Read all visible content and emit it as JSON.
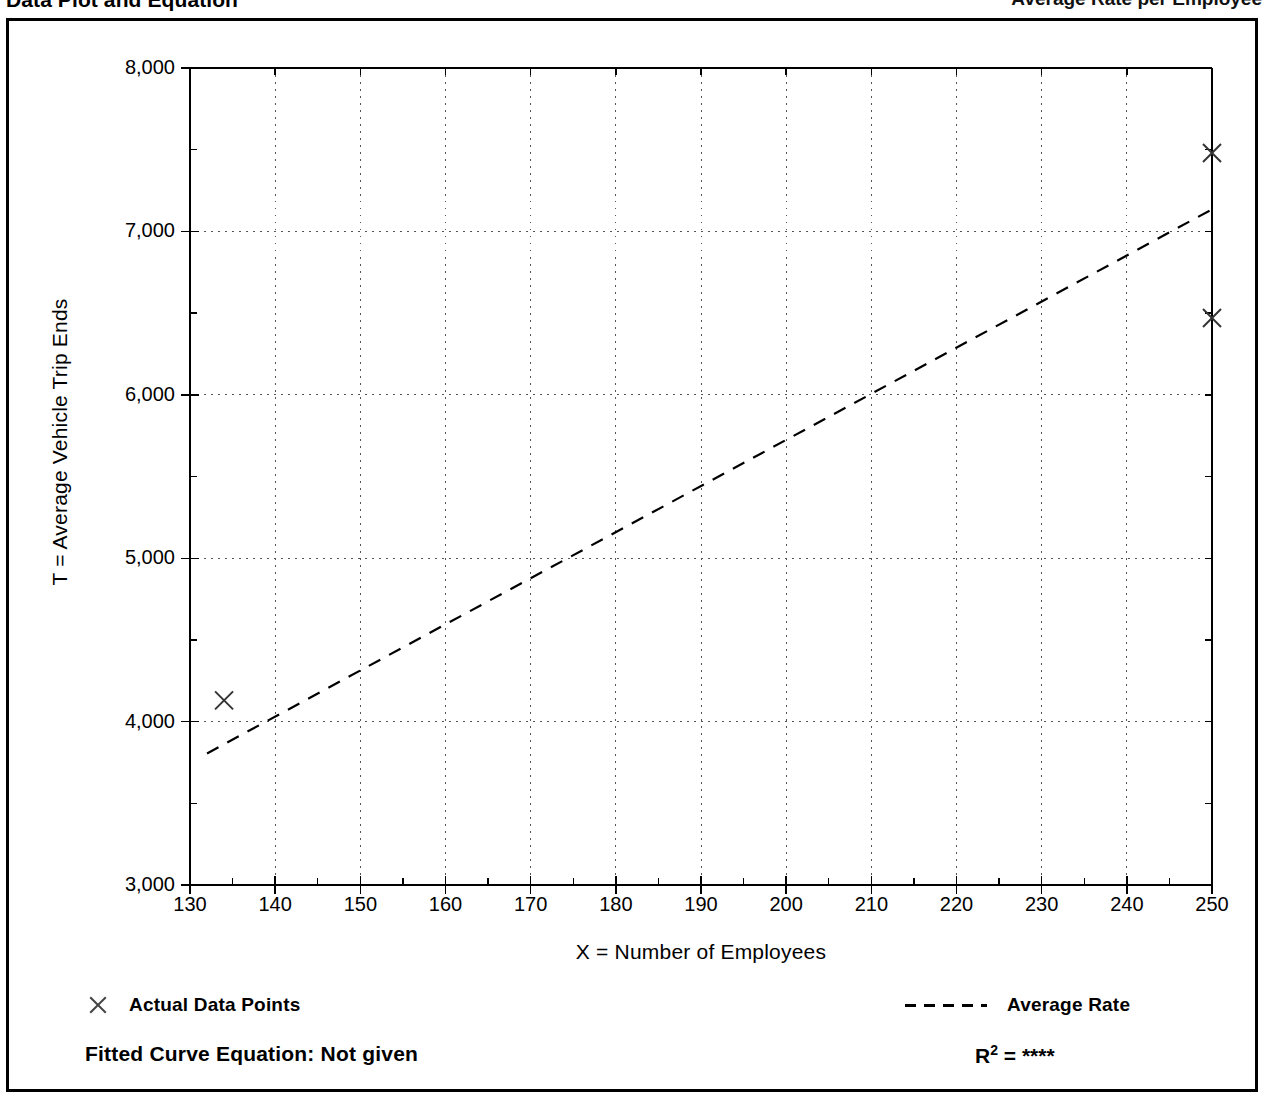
{
  "header": {
    "left_title": "Data Plot and Equation",
    "right_title": "Average Rate per Employee"
  },
  "chart_data": {
    "type": "scatter",
    "title": "",
    "xlabel": "X = Number of Employees",
    "ylabel": "T = Average Vehicle Trip Ends",
    "xlim": [
      130,
      250
    ],
    "ylim": [
      3000,
      8000
    ],
    "xticks": [
      130,
      140,
      150,
      160,
      170,
      180,
      190,
      200,
      210,
      220,
      230,
      240,
      250
    ],
    "xtick_labels": [
      "130",
      "140",
      "150",
      "160",
      "170",
      "180",
      "190",
      "200",
      "210",
      "220",
      "230",
      "240",
      "250"
    ],
    "yticks": [
      3000,
      4000,
      5000,
      6000,
      7000,
      8000
    ],
    "ytick_labels": [
      "3,000",
      "4,000",
      "5,000",
      "6,000",
      "7,000",
      "8,000"
    ],
    "grid": true,
    "grid_style": "dotted",
    "legend_position": "below-axes",
    "series": [
      {
        "name": "Actual Data Points",
        "type": "scatter",
        "marker": "x",
        "points": [
          {
            "x": 134,
            "y": 4130
          },
          {
            "x": 250,
            "y": 7480
          },
          {
            "x": 250,
            "y": 6470
          }
        ]
      },
      {
        "name": "Average Rate",
        "type": "line",
        "style": "dashed",
        "points": [
          {
            "x": 132,
            "y": 3805
          },
          {
            "x": 250,
            "y": 7135
          }
        ]
      }
    ],
    "annotations": {
      "fitted_equation": "Fitted Curve Equation:  Not given",
      "r_squared_label": "R",
      "r_squared_exponent": "2",
      "r_squared_equals": " = ",
      "r_squared_value": "****"
    }
  },
  "legend": {
    "data_points_label": "Actual Data Points",
    "average_rate_label": "Average Rate"
  },
  "colors": {
    "frame": "#000000",
    "grid": "#555555",
    "marker": "#333333",
    "trend": "#000000",
    "background": "#ffffff"
  }
}
